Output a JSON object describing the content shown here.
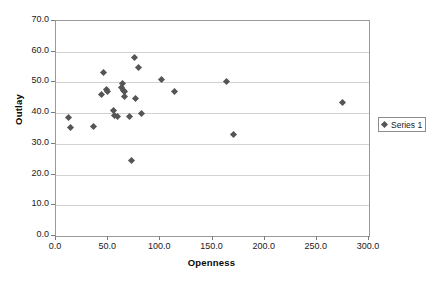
{
  "chart_data": {
    "type": "scatter",
    "title": "",
    "xlabel": "Openness",
    "ylabel": "Outlay",
    "xlim": [
      0.0,
      300.0
    ],
    "ylim": [
      0.0,
      70.0
    ],
    "xticks": [
      "0.0",
      "50.0",
      "100.0",
      "150.0",
      "200.0",
      "250.0",
      "300.0"
    ],
    "xtick_values": [
      0,
      50,
      100,
      150,
      200,
      250,
      300
    ],
    "yticks": [
      "0.0",
      "10.0",
      "20.0",
      "30.0",
      "40.0",
      "50.0",
      "60.0",
      "70.0"
    ],
    "ytick_values": [
      0,
      10,
      20,
      30,
      40,
      50,
      60,
      70
    ],
    "grid": "horizontal",
    "legend_position": "right",
    "marker_color": "#555555",
    "marker_shape": "diamond",
    "series": [
      {
        "name": "Series 1",
        "points": [
          [
            12.0,
            38.5
          ],
          [
            13.5,
            35.3
          ],
          [
            36.0,
            35.8
          ],
          [
            43.5,
            46.0
          ],
          [
            45.5,
            53.2
          ],
          [
            48.0,
            47.8
          ],
          [
            49.5,
            47.0
          ],
          [
            55.0,
            40.7
          ],
          [
            56.5,
            39.2
          ],
          [
            59.0,
            39.0
          ],
          [
            62.5,
            48.5
          ],
          [
            64.0,
            49.8
          ],
          [
            64.5,
            47.5
          ],
          [
            65.5,
            47.0
          ],
          [
            66.0,
            45.3
          ],
          [
            70.0,
            39.0
          ],
          [
            72.0,
            24.6
          ],
          [
            75.5,
            58.2
          ],
          [
            76.5,
            44.8
          ],
          [
            79.0,
            55.0
          ],
          [
            81.5,
            40.0
          ],
          [
            101.5,
            51.0
          ],
          [
            114.0,
            47.0
          ],
          [
            163.0,
            50.2
          ],
          [
            170.0,
            33.0
          ],
          [
            275.0,
            43.5
          ]
        ]
      }
    ]
  },
  "legend": {
    "entries": [
      {
        "label": "Series 1"
      }
    ]
  }
}
